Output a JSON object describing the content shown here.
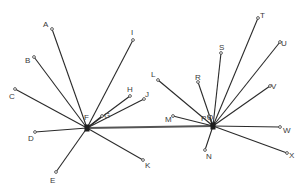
{
  "diagram": {
    "type": "two-hub star network",
    "colors": {
      "line": "#2a2a2a",
      "bridge": "#555555",
      "label": "#3a3a3a",
      "background": "#ffffff"
    },
    "hubs": [
      {
        "id": "F",
        "label": "F",
        "x": 87,
        "y": 128,
        "label_x": 84,
        "label_y": 120
      },
      {
        "id": "Q",
        "label": "Q",
        "x": 213,
        "y": 126,
        "label_x": 207,
        "label_y": 120
      }
    ],
    "bridge": {
      "from": "F",
      "to": "Q"
    },
    "nodes": [
      {
        "id": "A",
        "label": "A",
        "hub": "F",
        "x": 52,
        "y": 29,
        "label_x": 43,
        "label_y": 27
      },
      {
        "id": "B",
        "label": "B",
        "hub": "F",
        "x": 34,
        "y": 57,
        "label_x": 25,
        "label_y": 63
      },
      {
        "id": "C",
        "label": "C",
        "hub": "F",
        "x": 15,
        "y": 89,
        "label_x": 9,
        "label_y": 99
      },
      {
        "id": "D",
        "label": "D",
        "hub": "F",
        "x": 35,
        "y": 132,
        "label_x": 28,
        "label_y": 141
      },
      {
        "id": "E",
        "label": "E",
        "hub": "F",
        "x": 56,
        "y": 172,
        "label_x": 50,
        "label_y": 183
      },
      {
        "id": "G",
        "label": "G",
        "hub": "F",
        "x": 102,
        "y": 116,
        "label_x": 104,
        "label_y": 118
      },
      {
        "id": "H",
        "label": "H",
        "hub": "F",
        "x": 130,
        "y": 96,
        "label_x": 127,
        "label_y": 92
      },
      {
        "id": "I",
        "label": "I",
        "hub": "F",
        "x": 133,
        "y": 40,
        "label_x": 131,
        "label_y": 35
      },
      {
        "id": "J",
        "label": "J",
        "hub": "F",
        "x": 144,
        "y": 99,
        "label_x": 145,
        "label_y": 97
      },
      {
        "id": "K",
        "label": "K",
        "hub": "F",
        "x": 143,
        "y": 160,
        "label_x": 145,
        "label_y": 168
      },
      {
        "id": "L",
        "label": "L",
        "hub": "Q",
        "x": 158,
        "y": 80,
        "label_x": 151,
        "label_y": 77
      },
      {
        "id": "M",
        "label": "M",
        "hub": "Q",
        "x": 173,
        "y": 116,
        "label_x": 165,
        "label_y": 122
      },
      {
        "id": "N",
        "label": "N",
        "hub": "Q",
        "x": 205,
        "y": 150,
        "label_x": 206,
        "label_y": 159
      },
      {
        "id": "P",
        "label": "P",
        "hub": "Q",
        "x": 209,
        "y": 116,
        "label_x": 201,
        "label_y": 121
      },
      {
        "id": "R",
        "label": "R",
        "hub": "Q",
        "x": 198,
        "y": 82,
        "label_x": 195,
        "label_y": 80
      },
      {
        "id": "S",
        "label": "S",
        "hub": "Q",
        "x": 221,
        "y": 53,
        "label_x": 219,
        "label_y": 50
      },
      {
        "id": "T",
        "label": "T",
        "hub": "Q",
        "x": 258,
        "y": 18,
        "label_x": 260,
        "label_y": 18
      },
      {
        "id": "U",
        "label": "U",
        "hub": "Q",
        "x": 280,
        "y": 42,
        "label_x": 281,
        "label_y": 46
      },
      {
        "id": "V",
        "label": "V",
        "hub": "Q",
        "x": 270,
        "y": 86,
        "label_x": 271,
        "label_y": 89
      },
      {
        "id": "W",
        "label": "W",
        "hub": "Q",
        "x": 280,
        "y": 127,
        "label_x": 283,
        "label_y": 133
      },
      {
        "id": "X",
        "label": "X",
        "hub": "Q",
        "x": 287,
        "y": 153,
        "label_x": 289,
        "label_y": 158
      }
    ]
  }
}
